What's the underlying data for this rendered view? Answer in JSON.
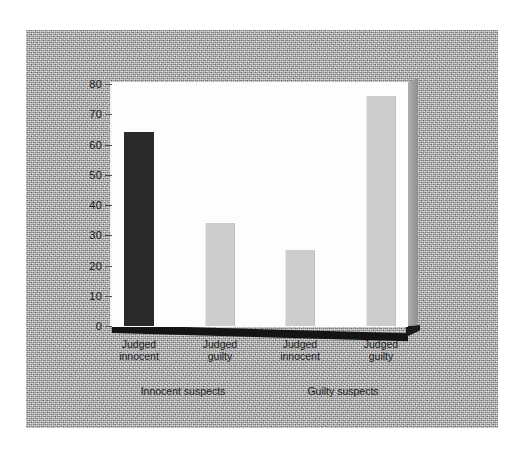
{
  "chart_data": {
    "type": "bar",
    "title": "",
    "subtitle": "",
    "xlabel": "",
    "ylabel": "",
    "ylim": [
      0,
      80
    ],
    "yticks": [
      0,
      10,
      20,
      30,
      40,
      50,
      60,
      70,
      80
    ],
    "ytick_labels": [
      "0",
      "10",
      "20",
      "30",
      "40",
      "50",
      "60",
      "70",
      "80"
    ],
    "grid": false,
    "legend": "none",
    "categories": [
      "Judged innocent",
      "Judged guilty",
      "Judged innocent",
      "Judged guilty"
    ],
    "values": [
      64,
      34,
      25,
      76
    ],
    "bar_colors": [
      "#2a2a2a",
      "#cdcdcd",
      "#cdcdcd",
      "#cdcdcd"
    ],
    "groups": [
      {
        "label": "Innocent suspects",
        "categories": [
          "Judged innocent",
          "Judged guilty"
        ],
        "values": [
          64,
          34
        ]
      },
      {
        "label": "Guilty suspects",
        "categories": [
          "Judged innocent",
          "Judged guilty"
        ],
        "values": [
          25,
          76
        ]
      }
    ]
  },
  "axis": {
    "ticks": [
      {
        "label": "80",
        "value": 80
      },
      {
        "label": "70",
        "value": 70
      },
      {
        "label": "60",
        "value": 60
      },
      {
        "label": "50",
        "value": 50
      },
      {
        "label": "40",
        "value": 40
      },
      {
        "label": "30",
        "value": 30
      },
      {
        "label": "20",
        "value": 20
      },
      {
        "label": "10",
        "value": 10
      },
      {
        "label": "0",
        "value": 0
      }
    ]
  },
  "bars": [
    {
      "label_line1": "Judged",
      "label_line2": "innocent",
      "value": 64,
      "color": "#2a2a2a"
    },
    {
      "label_line1": "Judged",
      "label_line2": "guilty",
      "value": 34,
      "color": "#cdcdcd"
    },
    {
      "label_line1": "Judged",
      "label_line2": "innocent",
      "value": 25,
      "color": "#cdcdcd"
    },
    {
      "label_line1": "Judged",
      "label_line2": "guilty",
      "value": 76,
      "color": "#cdcdcd"
    }
  ],
  "group_labels": [
    {
      "text": "Innocent suspects"
    },
    {
      "text": "Guilty suspects"
    }
  ],
  "colors": {
    "dark_bar": "#2a2a2a",
    "light_bar": "#cdcdcd",
    "panel": "#fdfdfd",
    "backdrop": "#b9b9b9",
    "slab_shadow": "#141414",
    "slab_side": "#9d9d9d",
    "text": "#1b1b1b"
  }
}
